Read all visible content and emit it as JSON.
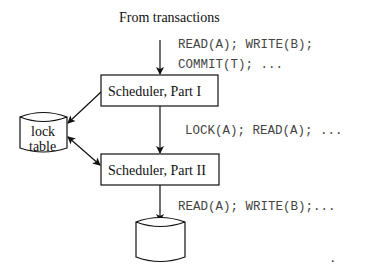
{
  "diagram": {
    "source_label": "From transactions",
    "input_requests": [
      "READ(A); WRITE(B);",
      "COMMIT(T); ..."
    ],
    "scheduler_part1": "Scheduler, Part I",
    "lock_table": [
      "lock",
      "table"
    ],
    "between_requests": "LOCK(A); READ(A); ...",
    "scheduler_part2": "Scheduler, Part II",
    "output_requests": "READ(A); WRITE(B);...",
    "database_label": "",
    "stray_dot": "."
  }
}
